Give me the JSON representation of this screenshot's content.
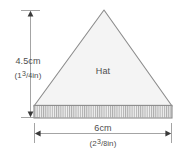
{
  "figure": {
    "shape_label": "Hat",
    "shape": {
      "kind": "triangle",
      "fill_color": "#f4f4f4",
      "stroke_color": "#8c8c8c",
      "apex": {
        "x": 104,
        "y": 10
      },
      "base_left": {
        "x": 34,
        "y": 106
      },
      "base_right": {
        "x": 172,
        "y": 106
      }
    },
    "fringe_band": {
      "name": "hatched-base-band",
      "top_y": 105,
      "bottom_y": 118,
      "left_x": 34,
      "right_x": 172,
      "tick_count": 64,
      "tick_color": "#9a9a9a",
      "fill_color": "#f0f0f0"
    },
    "dimensions": {
      "height": {
        "name": "height-dimension",
        "metric": "4.5cm",
        "imperial_whole": "1",
        "imperial_numerator": "3",
        "imperial_denominator": "4",
        "imperial_unit": "in",
        "imperial_full": "(1 3/4 in)",
        "line_x": 30,
        "top_y": 10,
        "bottom_y": 118
      },
      "width": {
        "name": "width-dimension",
        "metric": "6cm",
        "imperial_whole": "2",
        "imperial_numerator": "3",
        "imperial_denominator": "8",
        "imperial_unit": "in",
        "imperial_full": "(2 3/8 in)",
        "line_y": 133,
        "left_x": 34,
        "right_x": 172
      }
    },
    "colors": {
      "background": "#ffffff",
      "text": "#4d4d4d",
      "dimension_line": "#8c8c8c",
      "shape_outline": "#8c8c8c",
      "shape_fill": "#f4f4f4"
    }
  }
}
